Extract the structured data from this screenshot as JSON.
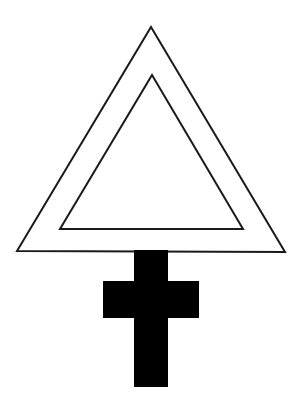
{
  "canvas": {
    "width": 303,
    "height": 403,
    "background_color": "#ffffff",
    "title": "Alchemical symbol: double triangle over cross"
  },
  "figure": {
    "name": "double-triangle-over-cross-symbol",
    "stroke_color": "#1a1a1a",
    "fill_color": "#000000",
    "stroke_width": 2
  },
  "shapes": {
    "outer_triangle": {
      "label": "Outer triangle",
      "fill": "none",
      "stroke": "#1a1a1a",
      "stroke_width": 2,
      "points": "151,27 285,252 17,251",
      "apex": {
        "x": 151,
        "y": 27
      },
      "bottom_left": {
        "x": 17,
        "y": 251
      },
      "bottom_right": {
        "x": 285,
        "y": 252
      }
    },
    "inner_triangle": {
      "label": "Inner triangle",
      "fill": "none",
      "stroke": "#1a1a1a",
      "stroke_width": 2,
      "points": "152,75 243,229 60,229",
      "apex": {
        "x": 152,
        "y": 75
      },
      "bottom_left": {
        "x": 60,
        "y": 229
      },
      "bottom_right": {
        "x": 243,
        "y": 229
      }
    },
    "cross": {
      "label": "Latin cross",
      "fill": "#000000",
      "stroke": "none",
      "vertical_bar": {
        "x": 134,
        "y": 250,
        "width": 34,
        "height": 137
      },
      "horizontal_arm": {
        "x": 103,
        "y": 281,
        "width": 96,
        "height": 37
      }
    }
  }
}
